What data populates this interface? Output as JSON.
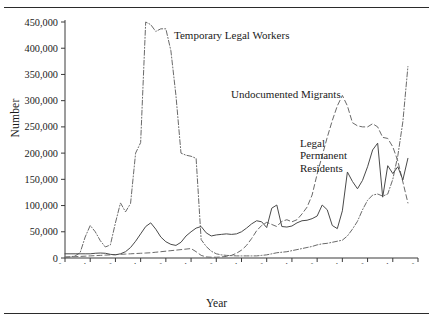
{
  "figure": {
    "y_axis_title": "Number",
    "x_axis_title": "Year",
    "annotations": {
      "temporary_legal_workers": "Temporary Legal Workers",
      "undocumented_migrants": "Undocumented Migrants",
      "legal_permanent_residents": "Legal\nPermanent\nResidents"
    }
  },
  "chart_data": {
    "type": "line",
    "title": "",
    "xlabel": "Year",
    "ylabel": "Number",
    "xlim": [
      1940,
      2010
    ],
    "ylim": [
      0,
      450000
    ],
    "grid": false,
    "legend_position": "inline-annotations",
    "xticks": [
      "1940",
      "1945",
      "1950",
      "1955",
      "1960",
      "1965",
      "1970",
      "1975",
      "1980",
      "1985",
      "1990",
      "1995",
      "2000",
      "2005",
      "2010"
    ],
    "yticks": [
      "0",
      "50,000",
      "100,000",
      "150,000",
      "200,000",
      "250,000",
      "300,000",
      "350,000",
      "400,000",
      "450,000"
    ],
    "x": [
      1940,
      1941,
      1942,
      1943,
      1944,
      1945,
      1946,
      1947,
      1948,
      1949,
      1950,
      1951,
      1952,
      1953,
      1954,
      1955,
      1956,
      1957,
      1958,
      1959,
      1960,
      1961,
      1962,
      1963,
      1964,
      1965,
      1966,
      1967,
      1968,
      1969,
      1970,
      1971,
      1972,
      1973,
      1974,
      1975,
      1976,
      1977,
      1978,
      1979,
      1980,
      1981,
      1982,
      1983,
      1984,
      1985,
      1986,
      1987,
      1988,
      1989,
      1990,
      1991,
      1992,
      1993,
      1994,
      1995,
      1996,
      1997,
      1998,
      1999,
      2000,
      2001,
      2002,
      2003,
      2004,
      2005,
      2006,
      2007,
      2008
    ],
    "series": [
      {
        "name": "Temporary Legal Workers",
        "style": "dash-dot",
        "values": [
          1000,
          2000,
          4000,
          10000,
          40000,
          62000,
          50000,
          33000,
          21000,
          25000,
          67000,
          105000,
          88000,
          104000,
          200000,
          220000,
          450000,
          445000,
          432000,
          437000,
          437000,
          395000,
          310000,
          200000,
          196000,
          194000,
          190000,
          35000,
          22000,
          13000,
          8000,
          6000,
          5000,
          4500,
          4000,
          4000,
          4000,
          4000,
          4000,
          5000,
          6000,
          8000,
          10000,
          11000,
          12000,
          14000,
          16000,
          18000,
          20000,
          22000,
          25000,
          27000,
          28000,
          30000,
          32000,
          34000,
          42000,
          55000,
          70000,
          92000,
          110000,
          120000,
          122000,
          118000,
          122000,
          150000,
          195000,
          260000,
          365000
        ]
      },
      {
        "name": "Undocumented Migrants",
        "style": "dashed",
        "values": [
          2000,
          2200,
          2500,
          3000,
          3500,
          4000,
          4500,
          5000,
          5500,
          6000,
          6500,
          7000,
          7500,
          8000,
          8500,
          9000,
          9500,
          10000,
          11000,
          12000,
          13000,
          14000,
          15000,
          16000,
          17000,
          18000,
          12000,
          5000,
          2000,
          1500,
          1500,
          2000,
          3000,
          5000,
          9000,
          15000,
          24000,
          37000,
          52000,
          62000,
          68000,
          64000,
          60000,
          70000,
          73000,
          69000,
          73000,
          84000,
          97000,
          120000,
          160000,
          195000,
          230000,
          262000,
          290000,
          310000,
          290000,
          258000,
          252000,
          250000,
          250000,
          256000,
          250000,
          230000,
          228000,
          212000,
          185000,
          145000,
          105000
        ]
      },
      {
        "name": "Legal Permanent Residents",
        "style": "solid",
        "values": [
          8000,
          8000,
          8000,
          8000,
          8000,
          8000,
          9000,
          9500,
          9000,
          7000,
          6000,
          8000,
          12000,
          20000,
          32000,
          46000,
          60000,
          67000,
          55000,
          40000,
          31000,
          26000,
          24000,
          30000,
          42000,
          50000,
          57000,
          60000,
          48000,
          42000,
          44000,
          45000,
          46000,
          45000,
          46000,
          50000,
          57000,
          65000,
          71000,
          69000,
          58000,
          95000,
          101000,
          60000,
          59000,
          61000,
          67000,
          71000,
          72000,
          75000,
          80000,
          101000,
          92000,
          62000,
          56000,
          90000,
          164000,
          146000,
          132000,
          148000,
          174000,
          206000,
          219000,
          116000,
          176000,
          161000,
          174000,
          149000,
          190000
        ]
      }
    ]
  }
}
